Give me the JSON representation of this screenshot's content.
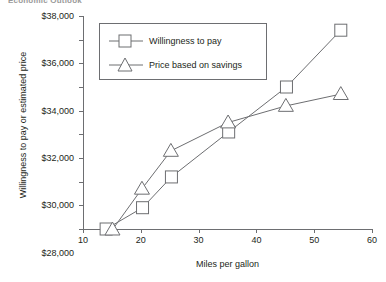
{
  "caption_fragment": "Economic Outlook",
  "chart_data": {
    "type": "line",
    "title": "",
    "xlabel": "Miles per gallon",
    "ylabel": "Willingness to pay or estimated price",
    "xlim": [
      10,
      60
    ],
    "ylim": [
      20000,
      38000
    ],
    "xticks": [
      10,
      20,
      30,
      40,
      50,
      60
    ],
    "xtick_labels": [
      "10",
      "20",
      "30",
      "40",
      "50",
      "60"
    ],
    "yticks": [
      20000,
      22000,
      24000,
      26000,
      28000,
      30000,
      32000,
      34000,
      36000,
      38000
    ],
    "ytick_labels": [
      "$20,000",
      "$22,000",
      "$24,000",
      "$26,000",
      "$28,000",
      "$30,000",
      "$32,000",
      "$34,000",
      "$36,000",
      "$38,000"
    ],
    "grid": false,
    "legend_position": "upper left",
    "line_color": "#6d6e71",
    "marker_face_color": "#ffffff",
    "series": [
      {
        "name": "Willingness to pay",
        "marker": "square",
        "x": [
          14,
          20.3,
          25.3,
          35.2,
          45.2,
          54.6
        ],
        "y": [
          20000,
          21800,
          24400,
          28200,
          32000,
          36800
        ],
        "points": [
          {
            "x": 14,
            "y": 20000
          },
          {
            "x": 20.3,
            "y": 21800
          },
          {
            "x": 25.3,
            "y": 24400
          },
          {
            "x": 35.2,
            "y": 28200
          },
          {
            "x": 45.2,
            "y": 32000
          },
          {
            "x": 54.6,
            "y": 36800
          }
        ]
      },
      {
        "name": "Price based on savings",
        "marker": "triangle",
        "x": [
          15.1,
          20.2,
          25.2,
          35.1,
          45.1,
          54.6
        ],
        "y": [
          19950,
          23400,
          26600,
          29000,
          30400,
          31400
        ],
        "points": [
          {
            "x": 15.1,
            "y": 19950
          },
          {
            "x": 20.2,
            "y": 23400
          },
          {
            "x": 25.2,
            "y": 26600
          },
          {
            "x": 35.1,
            "y": 29000
          },
          {
            "x": 45.1,
            "y": 30400
          },
          {
            "x": 54.6,
            "y": 31400
          }
        ]
      }
    ]
  }
}
